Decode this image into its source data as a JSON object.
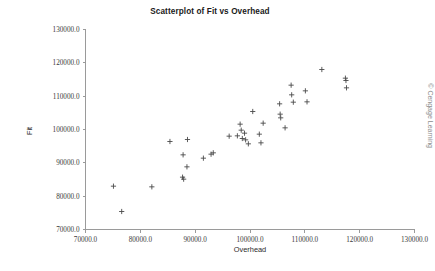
{
  "chart_data": {
    "type": "scatter",
    "title": "Scatterplot of Fit vs Overhead",
    "xlabel": "Overhead",
    "ylabel": "Fit",
    "xlim": [
      70000,
      130000
    ],
    "ylim": [
      70000,
      130000
    ],
    "xticks": [
      70000,
      80000,
      90000,
      100000,
      110000,
      120000,
      130000
    ],
    "yticks": [
      70000,
      80000,
      90000,
      100000,
      110000,
      120000,
      130000
    ],
    "xtick_labels": [
      "70000.0",
      "80000.0",
      "90000.0",
      "100000.0",
      "110000.0",
      "120000.0",
      "130000.0"
    ],
    "ytick_labels": [
      "70000.0",
      "80000.0",
      "90000.0",
      "100000.0",
      "110000.0",
      "120000.0",
      "130000.0"
    ],
    "grid": false,
    "legend": false,
    "marker": "plus",
    "marker_color": "#4a4a4a",
    "points": [
      {
        "x": 75100,
        "y": 83000
      },
      {
        "x": 76600,
        "y": 75400
      },
      {
        "x": 82100,
        "y": 82800
      },
      {
        "x": 85400,
        "y": 96400
      },
      {
        "x": 87800,
        "y": 92400
      },
      {
        "x": 87700,
        "y": 85700
      },
      {
        "x": 87900,
        "y": 85100
      },
      {
        "x": 88500,
        "y": 88800
      },
      {
        "x": 88600,
        "y": 97000
      },
      {
        "x": 91500,
        "y": 91400
      },
      {
        "x": 92900,
        "y": 92600
      },
      {
        "x": 93300,
        "y": 93000
      },
      {
        "x": 96200,
        "y": 98000
      },
      {
        "x": 97700,
        "y": 98100
      },
      {
        "x": 98200,
        "y": 101600
      },
      {
        "x": 98400,
        "y": 99800
      },
      {
        "x": 98600,
        "y": 97300
      },
      {
        "x": 99000,
        "y": 98900
      },
      {
        "x": 99200,
        "y": 96900
      },
      {
        "x": 99700,
        "y": 95700
      },
      {
        "x": 100500,
        "y": 105400
      },
      {
        "x": 101700,
        "y": 98600
      },
      {
        "x": 102000,
        "y": 96000
      },
      {
        "x": 102400,
        "y": 101900
      },
      {
        "x": 105400,
        "y": 107700
      },
      {
        "x": 105500,
        "y": 104600
      },
      {
        "x": 105600,
        "y": 103500
      },
      {
        "x": 106400,
        "y": 100500
      },
      {
        "x": 107500,
        "y": 113300
      },
      {
        "x": 107600,
        "y": 110400
      },
      {
        "x": 107900,
        "y": 108200
      },
      {
        "x": 110100,
        "y": 111600
      },
      {
        "x": 110400,
        "y": 108300
      },
      {
        "x": 113100,
        "y": 118000
      },
      {
        "x": 117400,
        "y": 115400
      },
      {
        "x": 117500,
        "y": 114700
      },
      {
        "x": 117600,
        "y": 112500
      }
    ]
  },
  "credit": "© Cengage Learning"
}
